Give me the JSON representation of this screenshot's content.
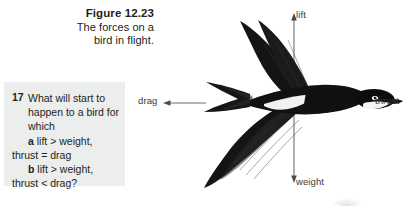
{
  "figure": {
    "title": "Figure 12.23",
    "caption_line_1": "The forces on a",
    "caption_line_2": "bird in flight."
  },
  "question": {
    "number": "17",
    "stem_line_1": "What will start to",
    "stem_line_2": "happen to a bird for",
    "stem_line_3": "which",
    "option_a_label": "a",
    "option_a_line_1": "lift > weight,",
    "option_a_line_2": "thrust = drag",
    "option_b_label": "b",
    "option_b_line_1": "lift > weight,",
    "option_b_line_2": "thrust < drag?",
    "background_color": "#eceded"
  },
  "diagram": {
    "type": "free-body-force-diagram",
    "forces": [
      {
        "name": "lift",
        "label": "lift",
        "direction": "up"
      },
      {
        "name": "weight",
        "label": "weight",
        "direction": "down"
      },
      {
        "name": "drag",
        "label": "drag",
        "direction": "left"
      },
      {
        "name": "thrust",
        "label": "thrust",
        "direction": "right"
      }
    ],
    "arrow_color": "#6e6e6e",
    "bird_color": "#111111"
  }
}
